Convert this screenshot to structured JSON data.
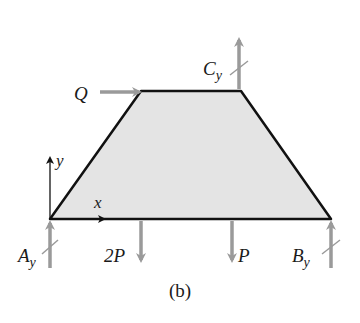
{
  "diagram": {
    "caption": "(b)",
    "body": {
      "shape": "trapezoid",
      "fill": "#e4e4e4",
      "stroke": "#111111"
    },
    "axes": {
      "x_label": "x",
      "y_label": "y"
    },
    "forces": [
      {
        "id": "Q",
        "label": "Q",
        "direction": "right"
      },
      {
        "id": "Cy",
        "label": "C",
        "sub": "y",
        "direction": "up"
      },
      {
        "id": "Ay",
        "label": "A",
        "sub": "y",
        "direction": "up"
      },
      {
        "id": "2P",
        "label": "2P",
        "direction": "down"
      },
      {
        "id": "P",
        "label": "P",
        "direction": "down"
      },
      {
        "id": "By",
        "label": "B",
        "sub": "y",
        "direction": "up"
      }
    ],
    "colors": {
      "arrow": "#9a9a9a",
      "outline": "#111111",
      "fill": "#e4e4e4"
    }
  }
}
